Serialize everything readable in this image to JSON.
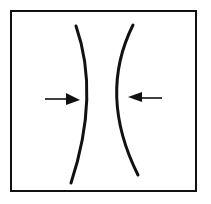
{
  "diagram": {
    "type": "illusion-line-drawing",
    "background": "#ffffff",
    "stroke_color": "#111111",
    "frame": {
      "x": 11,
      "y": 11,
      "width": 185,
      "height": 180
    },
    "curves": [
      {
        "name": "left-curve",
        "path": "M76,26 Q100,95 71,183"
      },
      {
        "name": "right-curve",
        "path": "M133,25 Q98,95 138,175"
      }
    ],
    "arrows": [
      {
        "name": "left-arrow",
        "direction": "right",
        "line": [
          45,
          99,
          68,
          99
        ],
        "head": "66,93 80,100 66,105"
      },
      {
        "name": "right-arrow",
        "direction": "left",
        "line": [
          140,
          98,
          162,
          98
        ],
        "head": "142,92 128,97 142,102"
      }
    ]
  }
}
